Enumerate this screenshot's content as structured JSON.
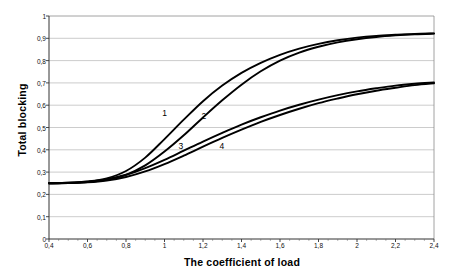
{
  "chart_data": {
    "type": "line",
    "title": "",
    "xlabel": "The coefficient of load",
    "ylabel": "Total blocking",
    "xlim": [
      0.4,
      2.4
    ],
    "ylim": [
      0,
      1
    ],
    "grid": true,
    "legend_position": "inline-curve-labels",
    "xticks": [
      "0,4",
      "0,6",
      "0,8",
      "1",
      "1,2",
      "1,4",
      "1,6",
      "1,8",
      "2",
      "2,2",
      "2,4"
    ],
    "xtick_values": [
      0.4,
      0.6,
      0.8,
      1.0,
      1.2,
      1.4,
      1.6,
      1.8,
      2.0,
      2.2,
      2.4
    ],
    "yticks": [
      "0",
      "0,1",
      "0,2",
      "0,3",
      "0,4",
      "0,5",
      "0,6",
      "0,7",
      "0,8",
      "0,9",
      "1"
    ],
    "ytick_values": [
      0,
      0.1,
      0.2,
      0.3,
      0.4,
      0.5,
      0.6,
      0.7,
      0.8,
      0.9,
      1.0
    ],
    "x": [
      0.4,
      0.5,
      0.6,
      0.7,
      0.8,
      0.9,
      1.0,
      1.1,
      1.2,
      1.3,
      1.4,
      1.5,
      1.6,
      1.7,
      1.8,
      1.9,
      2.0,
      2.1,
      2.2,
      2.3,
      2.4
    ],
    "series": [
      {
        "name": "1",
        "label": "1",
        "label_x": 1.0,
        "label_y": 0.565,
        "color": "#000000",
        "values": [
          0.25,
          0.252,
          0.258,
          0.272,
          0.305,
          0.365,
          0.448,
          0.535,
          0.618,
          0.688,
          0.745,
          0.79,
          0.826,
          0.854,
          0.875,
          0.891,
          0.903,
          0.911,
          0.916,
          0.92,
          0.922
        ]
      },
      {
        "name": "2",
        "label": "2",
        "label_x": 1.205,
        "label_y": 0.552,
        "color": "#000000",
        "values": [
          0.25,
          0.251,
          0.255,
          0.265,
          0.288,
          0.33,
          0.392,
          0.465,
          0.545,
          0.622,
          0.692,
          0.752,
          0.8,
          0.836,
          0.862,
          0.882,
          0.896,
          0.906,
          0.913,
          0.918,
          0.921
        ]
      },
      {
        "name": "3",
        "label": "3",
        "label_x": 1.085,
        "label_y": 0.418,
        "color": "#000000",
        "values": [
          0.25,
          0.252,
          0.257,
          0.268,
          0.288,
          0.318,
          0.355,
          0.396,
          0.437,
          0.476,
          0.513,
          0.546,
          0.576,
          0.602,
          0.625,
          0.645,
          0.662,
          0.676,
          0.688,
          0.696,
          0.702
        ]
      },
      {
        "name": "4",
        "label": "4",
        "label_x": 1.298,
        "label_y": 0.418,
        "color": "#000000",
        "values": [
          0.25,
          0.251,
          0.254,
          0.262,
          0.278,
          0.303,
          0.336,
          0.374,
          0.414,
          0.453,
          0.49,
          0.525,
          0.556,
          0.584,
          0.609,
          0.63,
          0.649,
          0.665,
          0.678,
          0.69,
          0.698
        ]
      }
    ]
  },
  "axes": {
    "x_title": "The coefficient of load",
    "y_title": "Total blocking"
  }
}
